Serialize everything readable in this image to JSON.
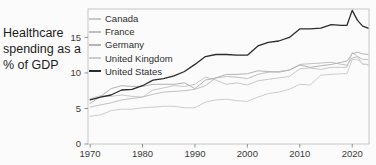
{
  "chart_data": {
    "type": "line",
    "title": "Healthcare spending as a % of GDP",
    "xlabel": "",
    "ylabel": "",
    "legend_position": "top-left-inside",
    "grid": false,
    "xlim": [
      1969.6,
      2023.2
    ],
    "ylim": [
      0,
      19
    ],
    "x_ticks": [
      1970,
      1980,
      1990,
      2000,
      2010,
      2020
    ],
    "y_ticks": [
      0,
      5,
      10,
      15
    ],
    "x": [
      1970,
      1972,
      1974,
      1976,
      1978,
      1980,
      1982,
      1984,
      1986,
      1988,
      1990,
      1992,
      1994,
      1996,
      1998,
      2000,
      2002,
      2004,
      2006,
      2008,
      2010,
      2012,
      2014,
      2016,
      2018,
      2019,
      2020,
      2021,
      2022,
      2023
    ],
    "series": [
      {
        "name": "Canada",
        "color": "#c8c8c8",
        "values": [
          6.4,
          6.8,
          6.7,
          6.9,
          6.7,
          6.6,
          7.6,
          7.9,
          8.2,
          8.1,
          8.4,
          9.4,
          9.0,
          8.4,
          8.6,
          8.3,
          8.9,
          9.1,
          9.3,
          9.5,
          10.6,
          10.7,
          10.5,
          10.8,
          10.8,
          10.8,
          12.9,
          12.3,
          11.2,
          11.2
        ]
      },
      {
        "name": "France",
        "color": "#c0c0c0",
        "values": [
          5.2,
          5.5,
          5.8,
          6.2,
          6.4,
          6.6,
          7.0,
          7.3,
          7.4,
          7.5,
          7.7,
          8.2,
          9.3,
          9.5,
          9.4,
          9.2,
          9.8,
          10.1,
          10.2,
          10.4,
          11.2,
          11.3,
          11.4,
          11.5,
          11.2,
          11.1,
          12.1,
          12.3,
          11.9,
          11.9
        ]
      },
      {
        "name": "Germany",
        "color": "#b3b3b3",
        "values": [
          5.7,
          6.7,
          7.8,
          8.2,
          8.1,
          8.1,
          8.4,
          8.4,
          8.4,
          8.6,
          7.8,
          9.0,
          9.3,
          9.8,
          9.8,
          9.9,
          10.3,
          10.2,
          10.1,
          10.4,
          11.1,
          10.8,
          11.0,
          11.2,
          11.5,
          11.7,
          12.7,
          12.9,
          12.7,
          12.6
        ]
      },
      {
        "name": "United Kingdom",
        "color": "#cdcdcd",
        "values": [
          3.9,
          4.1,
          4.7,
          4.9,
          4.9,
          5.1,
          5.2,
          5.3,
          5.3,
          5.1,
          5.1,
          5.9,
          6.2,
          6.3,
          6.1,
          6.0,
          6.6,
          7.1,
          7.3,
          7.7,
          8.4,
          8.3,
          9.7,
          9.8,
          9.9,
          9.9,
          11.9,
          11.9,
          11.3,
          11.1
        ]
      },
      {
        "name": "United States",
        "color": "#2b2b2b",
        "values": [
          6.2,
          6.6,
          6.9,
          7.6,
          7.7,
          8.2,
          9.0,
          9.2,
          9.6,
          10.2,
          11.2,
          12.3,
          12.6,
          12.6,
          12.5,
          12.5,
          13.8,
          14.3,
          14.5,
          15.0,
          16.2,
          16.2,
          16.3,
          16.8,
          16.7,
          16.7,
          18.8,
          17.4,
          16.6,
          16.3
        ]
      }
    ]
  },
  "style": {
    "background": "#fbfbfb",
    "frame_color": "#c6c6c6",
    "tick_color": "#8f8f8f",
    "tick_label_color": "#3a3a3a",
    "title_color": "#1c1c1c",
    "highlight_series_color": "#2b2b2b"
  }
}
